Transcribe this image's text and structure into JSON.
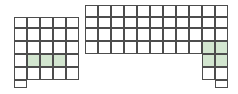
{
  "canvas": {
    "width": 238,
    "height": 94,
    "background": "#ffffff"
  },
  "grid": {
    "name": "stepped-cell-grid",
    "cell_width": 13,
    "cell_height": 13.2,
    "origin_x": 14,
    "origin_y": 5,
    "line_color": "#4d4d4d",
    "line_width": 1,
    "highlight_color": "#d3e6d0",
    "highlight_stroke": "#a9c7a4",
    "empty_color": "#ffffff",
    "columns": 17,
    "rows": 7,
    "description": "U-shaped / stepped block grid with pale green highlighted cells"
  },
  "chart_data": {
    "type": "heatmap",
    "title": "",
    "xlabel": "",
    "ylabel": "",
    "legend": [],
    "cell_size": 13,
    "col_edges": [
      14,
      27,
      40,
      53,
      66,
      79,
      85,
      98,
      111,
      124,
      137,
      150,
      163,
      176,
      189,
      202,
      215,
      228
    ],
    "row_edges": [
      5,
      17,
      28,
      41,
      54,
      67,
      80,
      88
    ],
    "columns": 17,
    "rows": 7,
    "cells": [
      {
        "col": 6,
        "row": 0,
        "state": "empty"
      },
      {
        "col": 7,
        "row": 0,
        "state": "empty"
      },
      {
        "col": 8,
        "row": 0,
        "state": "empty"
      },
      {
        "col": 9,
        "row": 0,
        "state": "empty"
      },
      {
        "col": 10,
        "row": 0,
        "state": "empty"
      },
      {
        "col": 11,
        "row": 0,
        "state": "empty"
      },
      {
        "col": 12,
        "row": 0,
        "state": "empty"
      },
      {
        "col": 13,
        "row": 0,
        "state": "empty"
      },
      {
        "col": 14,
        "row": 0,
        "state": "empty"
      },
      {
        "col": 15,
        "row": 0,
        "state": "empty"
      },
      {
        "col": 16,
        "row": 0,
        "state": "empty"
      },
      {
        "col": 0,
        "row": 1,
        "state": "empty"
      },
      {
        "col": 1,
        "row": 1,
        "state": "empty"
      },
      {
        "col": 2,
        "row": 1,
        "state": "empty"
      },
      {
        "col": 3,
        "row": 1,
        "state": "empty"
      },
      {
        "col": 4,
        "row": 1,
        "state": "empty"
      },
      {
        "col": 6,
        "row": 1,
        "state": "empty"
      },
      {
        "col": 7,
        "row": 1,
        "state": "empty"
      },
      {
        "col": 8,
        "row": 1,
        "state": "empty"
      },
      {
        "col": 9,
        "row": 1,
        "state": "empty"
      },
      {
        "col": 10,
        "row": 1,
        "state": "empty"
      },
      {
        "col": 11,
        "row": 1,
        "state": "empty"
      },
      {
        "col": 12,
        "row": 1,
        "state": "empty"
      },
      {
        "col": 13,
        "row": 1,
        "state": "empty"
      },
      {
        "col": 14,
        "row": 1,
        "state": "empty"
      },
      {
        "col": 15,
        "row": 1,
        "state": "empty"
      },
      {
        "col": 16,
        "row": 1,
        "state": "empty"
      },
      {
        "col": 0,
        "row": 2,
        "state": "empty"
      },
      {
        "col": 1,
        "row": 2,
        "state": "empty"
      },
      {
        "col": 2,
        "row": 2,
        "state": "empty"
      },
      {
        "col": 3,
        "row": 2,
        "state": "empty"
      },
      {
        "col": 4,
        "row": 2,
        "state": "empty"
      },
      {
        "col": 6,
        "row": 2,
        "state": "empty"
      },
      {
        "col": 7,
        "row": 2,
        "state": "empty"
      },
      {
        "col": 8,
        "row": 2,
        "state": "empty"
      },
      {
        "col": 9,
        "row": 2,
        "state": "empty"
      },
      {
        "col": 10,
        "row": 2,
        "state": "empty"
      },
      {
        "col": 11,
        "row": 2,
        "state": "empty"
      },
      {
        "col": 12,
        "row": 2,
        "state": "empty"
      },
      {
        "col": 13,
        "row": 2,
        "state": "empty"
      },
      {
        "col": 14,
        "row": 2,
        "state": "empty"
      },
      {
        "col": 15,
        "row": 2,
        "state": "empty"
      },
      {
        "col": 16,
        "row": 2,
        "state": "empty"
      },
      {
        "col": 0,
        "row": 3,
        "state": "empty"
      },
      {
        "col": 1,
        "row": 3,
        "state": "empty"
      },
      {
        "col": 2,
        "row": 3,
        "state": "empty"
      },
      {
        "col": 3,
        "row": 3,
        "state": "empty"
      },
      {
        "col": 4,
        "row": 3,
        "state": "empty"
      },
      {
        "col": 6,
        "row": 3,
        "state": "empty"
      },
      {
        "col": 7,
        "row": 3,
        "state": "empty"
      },
      {
        "col": 8,
        "row": 3,
        "state": "empty"
      },
      {
        "col": 9,
        "row": 3,
        "state": "empty"
      },
      {
        "col": 10,
        "row": 3,
        "state": "empty"
      },
      {
        "col": 11,
        "row": 3,
        "state": "empty"
      },
      {
        "col": 12,
        "row": 3,
        "state": "empty"
      },
      {
        "col": 13,
        "row": 3,
        "state": "empty"
      },
      {
        "col": 14,
        "row": 3,
        "state": "empty"
      },
      {
        "col": 15,
        "row": 3,
        "state": "highlighted"
      },
      {
        "col": 16,
        "row": 3,
        "state": "highlighted"
      },
      {
        "col": 0,
        "row": 4,
        "state": "empty"
      },
      {
        "col": 1,
        "row": 4,
        "state": "highlighted"
      },
      {
        "col": 2,
        "row": 4,
        "state": "highlighted"
      },
      {
        "col": 3,
        "row": 4,
        "state": "highlighted"
      },
      {
        "col": 4,
        "row": 4,
        "state": "empty"
      },
      {
        "col": 15,
        "row": 4,
        "state": "highlighted"
      },
      {
        "col": 16,
        "row": 4,
        "state": "highlighted"
      },
      {
        "col": 0,
        "row": 5,
        "state": "empty"
      },
      {
        "col": 1,
        "row": 5,
        "state": "empty"
      },
      {
        "col": 2,
        "row": 5,
        "state": "empty"
      },
      {
        "col": 3,
        "row": 5,
        "state": "empty"
      },
      {
        "col": 4,
        "row": 5,
        "state": "empty"
      },
      {
        "col": 15,
        "row": 5,
        "state": "empty"
      },
      {
        "col": 16,
        "row": 5,
        "state": "empty"
      },
      {
        "col": 0,
        "row": 6,
        "state": "empty"
      },
      {
        "col": 16,
        "row": 6,
        "state": "empty"
      }
    ],
    "highlighted_count": 7,
    "total_count": 81
  }
}
